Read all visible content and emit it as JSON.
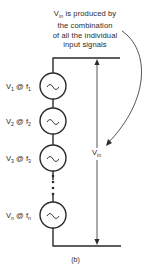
{
  "diagram": {
    "caption": {
      "line1_prefix": "V",
      "line1_sub": "in",
      "line1_rest": " is produced by",
      "line2": "the combination",
      "line3": "of all the individual",
      "line4": "input signals"
    },
    "sources": [
      {
        "v": "V",
        "v_sub": "1",
        "at": " @ f",
        "f_sub": "1"
      },
      {
        "v": "V",
        "v_sub": "2",
        "at": " @ f",
        "f_sub": "2"
      },
      {
        "v": "V",
        "v_sub": "3",
        "at": " @ f",
        "f_sub": "3"
      },
      {
        "v": "V",
        "v_sub": "n",
        "at": " @ f",
        "f_sub": "n"
      }
    ],
    "source_symbol": "~",
    "vin_label": {
      "v": "V",
      "sub": "in"
    },
    "figure_label": "(b)",
    "colors": {
      "line": "#2a2a2a",
      "background": "#ffffff"
    }
  }
}
